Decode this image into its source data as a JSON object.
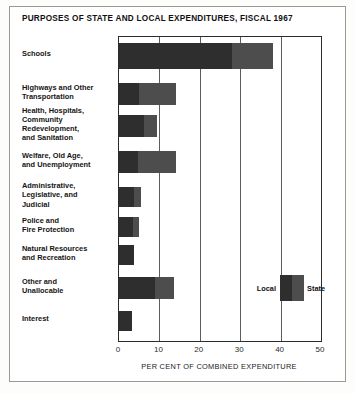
{
  "chart_data": {
    "type": "bar",
    "orientation": "horizontal",
    "stacked": true,
    "title": "PURPOSES OF STATE AND LOCAL EXPENDITURES, FISCAL 1967",
    "xlabel": "PER CENT OF COMBINED EXPENDITURE",
    "ylabel": "",
    "xlim": [
      0,
      50
    ],
    "xticks": [
      0,
      10,
      20,
      30,
      40,
      50
    ],
    "xtick_labels": [
      "0",
      "10",
      "20",
      "30",
      "40",
      "50"
    ],
    "grid": true,
    "legend_position": "inside-right",
    "categories": [
      "Schools",
      "Highways and Other Transportation",
      "Health, Hospitals, Community Redevelopment, and Sanitation",
      "Welfare, Old Age, and Unemployment",
      "Administrative, Legislative, and Judicial",
      "Police and Fire Protection",
      "Natural Resources and Recreation",
      "Other and Unallocable",
      "Interest"
    ],
    "series": [
      {
        "name": "Local",
        "color": "#2e2e2e",
        "values": [
          28.0,
          5.0,
          6.2,
          4.8,
          3.8,
          3.5,
          3.8,
          9.0,
          3.2
        ]
      },
      {
        "name": "State",
        "color": "#4d4d4d",
        "values": [
          10.0,
          9.0,
          3.3,
          9.2,
          1.7,
          1.5,
          0.0,
          4.5,
          0.0
        ]
      }
    ],
    "totals": [
      38.0,
      14.0,
      9.5,
      14.0,
      5.5,
      5.0,
      3.8,
      13.5,
      3.2
    ]
  },
  "legend": {
    "local_label": "Local",
    "state_label": "State"
  },
  "labels": {
    "rows": [
      "Schools",
      "Highways and Other\nTransportation",
      "Health, Hospitals,\nCommunity\nRedevelopment,\nand Sanitation",
      "Welfare, Old Age,\nand Unemployment",
      "Administrative,\nLegislative, and\nJudicial",
      "Police and\nFire Protection",
      "Natural Resources\nand Recreation",
      "Other and\nUnallocable",
      "Interest"
    ]
  }
}
